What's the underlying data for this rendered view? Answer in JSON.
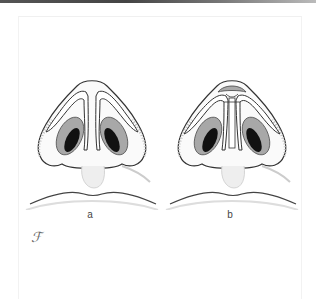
{
  "figure": {
    "panels": [
      {
        "id": "a",
        "label": "a",
        "description": "nasal base view, basal/inferior view of nose with lower lateral cartilages"
      },
      {
        "id": "b",
        "label": "b",
        "description": "nasal base view with modified domes and columellar strut graft"
      }
    ],
    "monogram": "ℱ",
    "colors": {
      "line": "#333333",
      "nostril_dark": "#111111",
      "nostril_mid": "#9a9a9a",
      "shading": "#cfcfcf",
      "top_bar": "#555555"
    }
  }
}
